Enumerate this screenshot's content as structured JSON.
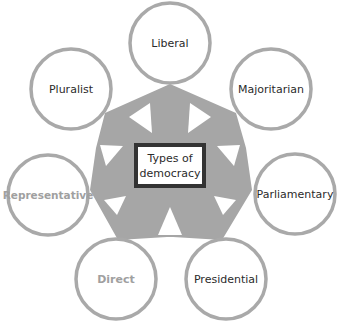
{
  "diagram": {
    "title_line1": "Types of",
    "title_line2": "democracy",
    "colors": {
      "circle_stroke": "#a9a9a9",
      "arrow_fill": "#a6a6a6",
      "center_border": "#333333",
      "label_text": "#2b2b2b",
      "muted_label_text": "#a0a0a0"
    },
    "nodes": [
      {
        "label": "Liberal",
        "muted": false
      },
      {
        "label": "Majoritarian",
        "muted": false
      },
      {
        "label": "Parliamentary",
        "muted": false
      },
      {
        "label": "Presidential",
        "muted": false
      },
      {
        "label": "Direct",
        "muted": true
      },
      {
        "label": "Representative",
        "muted": true
      },
      {
        "label": "Pluralist",
        "muted": false
      }
    ]
  }
}
